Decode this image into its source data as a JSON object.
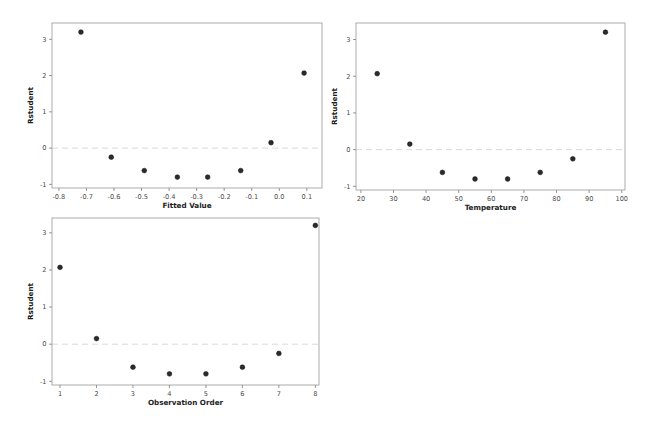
{
  "panel": {
    "name": "Residual diagnostic plots",
    "background_color": "#ffffff",
    "point_color": "#2b2b2b",
    "frame_color": "#ababab",
    "tick_color": "#8a8a8a",
    "refline_color": "#d9d9d9",
    "tick_label_color": "#4a4a4a",
    "axis_label_color": "#1c1c1c"
  },
  "chart_data": [
    {
      "type": "scatter",
      "title": "",
      "xlabel": "Fitted Value",
      "ylabel": "Rstudent",
      "xlim": [
        -0.825,
        0.155
      ],
      "ylim": [
        -1.1,
        3.45
      ],
      "xticks": [
        -0.8,
        -0.7,
        -0.6,
        -0.5,
        -0.4,
        -0.3,
        -0.2,
        -0.1,
        0.0,
        0.1
      ],
      "xtick_labels": [
        "-0.8",
        "-0.7",
        "-0.6",
        "-0.5",
        "-0.4",
        "-0.3",
        "-0.2",
        "-0.1",
        "0.0",
        "0.1"
      ],
      "yticks": [
        -1,
        0,
        1,
        2,
        3
      ],
      "ytick_labels": [
        "-1",
        "0",
        "1",
        "2",
        "3"
      ],
      "grid": false,
      "legend": false,
      "refline_y": 0,
      "x": [
        -0.72,
        -0.61,
        -0.49,
        -0.37,
        -0.26,
        -0.14,
        -0.03,
        0.09
      ],
      "y": [
        3.2,
        -0.25,
        -0.62,
        -0.8,
        -0.8,
        -0.62,
        0.15,
        2.07
      ]
    },
    {
      "type": "scatter",
      "title": "",
      "xlabel": "Temperature",
      "ylabel": "Rstudent",
      "xlim": [
        18.5,
        101
      ],
      "ylim": [
        -1.1,
        3.45
      ],
      "xticks": [
        20,
        30,
        40,
        50,
        60,
        70,
        80,
        90,
        100
      ],
      "xtick_labels": [
        "20",
        "30",
        "40",
        "50",
        "60",
        "70",
        "80",
        "90",
        "100"
      ],
      "yticks": [
        -1,
        0,
        1,
        2,
        3
      ],
      "ytick_labels": [
        "-1",
        "0",
        "1",
        "2",
        "3"
      ],
      "grid": false,
      "legend": false,
      "refline_y": 0,
      "x": [
        25,
        35,
        45,
        55,
        65,
        75,
        85,
        95
      ],
      "y": [
        2.07,
        0.15,
        -0.62,
        -0.8,
        -0.8,
        -0.62,
        -0.25,
        3.2
      ]
    },
    {
      "type": "scatter",
      "title": "",
      "xlabel": "Observation Order",
      "ylabel": "Rstudent",
      "xlim": [
        0.78,
        8.1
      ],
      "ylim": [
        -1.1,
        3.4
      ],
      "xticks": [
        1,
        2,
        3,
        4,
        5,
        6,
        7,
        8
      ],
      "xtick_labels": [
        "1",
        "2",
        "3",
        "4",
        "5",
        "6",
        "7",
        "8"
      ],
      "yticks": [
        -1,
        0,
        1,
        2,
        3
      ],
      "ytick_labels": [
        "-1",
        "0",
        "1",
        "2",
        "3"
      ],
      "grid": false,
      "legend": false,
      "refline_y": 0,
      "x": [
        1,
        2,
        3,
        4,
        5,
        6,
        7,
        8
      ],
      "y": [
        2.07,
        0.15,
        -0.62,
        -0.8,
        -0.8,
        -0.62,
        -0.25,
        3.2
      ]
    }
  ]
}
